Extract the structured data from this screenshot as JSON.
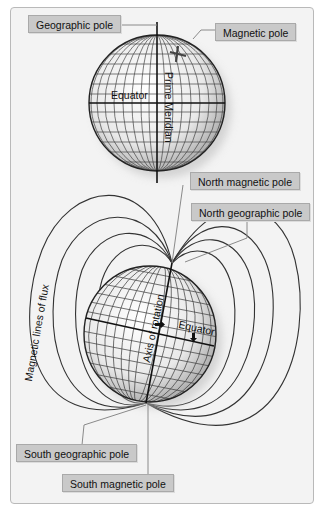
{
  "top_globe": {
    "labels": {
      "geographic_pole": "Geographic pole",
      "magnetic_pole": "Magnetic pole",
      "equator": "Equator",
      "prime_meridian": "Prime Meridian"
    }
  },
  "bottom_globe": {
    "labels": {
      "north_magnetic_pole": "North magnetic pole",
      "north_geographic_pole": "North geographic pole",
      "magnetic_lines_of_flux": "Magnetic lines of flux",
      "axis_of_rotation": "Axis of rotation",
      "equator": "Equator",
      "south_geographic_pole": "South geographic pole",
      "south_magnetic_pole": "South magnetic pole"
    }
  },
  "colors": {
    "frame_bg": "#f3f3f3",
    "label_bg": "#c9c9c9",
    "line": "#333333",
    "leader": "#8a8a8a"
  }
}
